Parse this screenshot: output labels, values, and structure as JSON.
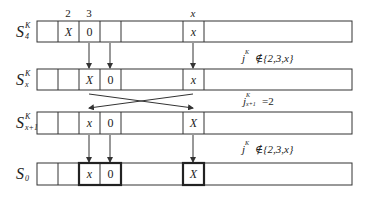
{
  "diagram": {
    "column_headers": [
      {
        "label": "2",
        "x": 68
      },
      {
        "label": "3",
        "x": 89
      },
      {
        "label": "x",
        "x": 193
      }
    ],
    "rows": [
      {
        "id": "S4K",
        "label_main": "S",
        "label_sup": "K",
        "label_sub": "4",
        "cells": [
          "",
          "",
          "X",
          "0",
          "x"
        ],
        "bold_cells": []
      },
      {
        "id": "SxK",
        "label_main": "S",
        "label_sup": "K",
        "label_sub": "x",
        "cells": [
          "",
          "",
          "X",
          "0",
          "x"
        ],
        "bold_cells": []
      },
      {
        "id": "Sx1K",
        "label_main": "S",
        "label_sup": "K",
        "label_sub": "x+1",
        "cells": [
          "",
          "",
          "x",
          "0",
          "X"
        ],
        "bold_cells": []
      },
      {
        "id": "S0",
        "label_main": "S",
        "label_sup": "",
        "label_sub": "0",
        "cells": [
          "",
          "",
          "x",
          "0",
          "X"
        ],
        "bold_cells": [
          2,
          3,
          4
        ]
      }
    ],
    "conditions": [
      {
        "id": "cond1",
        "var": "j",
        "sup": "K",
        "sub": "",
        "rel": "∉",
        "rhs": "{2,3,x}"
      },
      {
        "id": "cond2",
        "var": "j",
        "sup": "K",
        "sub": "x+1",
        "rel": "=",
        "rhs": "2"
      },
      {
        "id": "cond3",
        "var": "j",
        "sup": "K",
        "sub": "",
        "rel": "∉",
        "rhs": "{2,3,x}"
      }
    ],
    "colors": {
      "stroke": "#333333",
      "text": "#222222",
      "background": "#ffffff"
    }
  }
}
